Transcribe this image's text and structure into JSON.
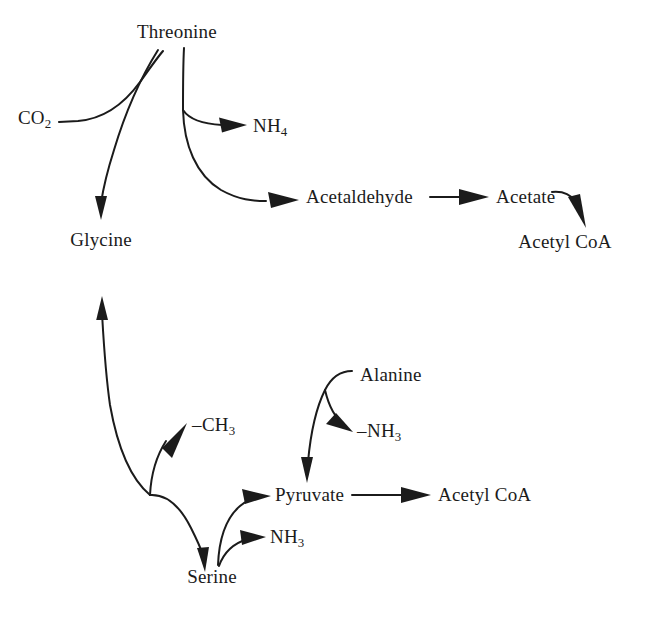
{
  "diagram": {
    "background_color": "#ffffff",
    "stroke_color": "#1b1b1b",
    "text_color": "#1b1b1b",
    "width": 659,
    "height": 620,
    "nodes": [
      {
        "id": "threonine",
        "label": "Threonine",
        "x": 177,
        "y": 33,
        "anchor": "center"
      },
      {
        "id": "co2",
        "label": "CO",
        "sub": "2",
        "x": 18,
        "y": 118,
        "anchor": "left"
      },
      {
        "id": "nh4",
        "label": "NH",
        "sub": "4",
        "x": 253,
        "y": 126,
        "anchor": "left"
      },
      {
        "id": "glycine",
        "label": "Glycine",
        "x": 101,
        "y": 241,
        "anchor": "center"
      },
      {
        "id": "acetaldehyde",
        "label": "Acetaldehyde",
        "x": 306,
        "y": 198,
        "anchor": "left"
      },
      {
        "id": "acetate",
        "label": "Acetate",
        "x": 496,
        "y": 198,
        "anchor": "left"
      },
      {
        "id": "acetyl_coa_1",
        "label": "Acetyl CoA",
        "x": 565,
        "y": 243,
        "anchor": "center"
      },
      {
        "id": "ch3",
        "label": "CH",
        "sub": "3",
        "neg": true,
        "x": 192,
        "y": 426,
        "anchor": "left"
      },
      {
        "id": "alanine",
        "label": "Alanine",
        "x": 360,
        "y": 376,
        "anchor": "left"
      },
      {
        "id": "nh3_alanine",
        "label": "NH",
        "sub": "3",
        "neg": true,
        "x": 357,
        "y": 432,
        "anchor": "left"
      },
      {
        "id": "pyruvate",
        "label": "Pyruvate",
        "x": 275,
        "y": 496,
        "anchor": "left"
      },
      {
        "id": "nh3_serine",
        "label": "NH",
        "sub": "3",
        "x": 270,
        "y": 538,
        "anchor": "left"
      },
      {
        "id": "acetyl_coa_2",
        "label": "Acetyl CoA",
        "x": 438,
        "y": 496,
        "anchor": "left"
      },
      {
        "id": "serine",
        "label": "Serine",
        "x": 212,
        "y": 578,
        "anchor": "center"
      }
    ],
    "edges": [
      {
        "id": "co2-to-threonine",
        "from": "co2",
        "to": "threonine",
        "style": "curved",
        "arrowhead": false
      },
      {
        "id": "threonine-to-glycine",
        "from": "threonine",
        "to": "glycine",
        "style": "curved",
        "arrowhead": true
      },
      {
        "id": "threonine-to-nh4",
        "from": "threonine",
        "to": "nh4",
        "style": "curved",
        "arrowhead": true
      },
      {
        "id": "threonine-to-acetaldehyde",
        "from": "threonine",
        "to": "acetaldehyde",
        "style": "curved",
        "arrowhead": true
      },
      {
        "id": "acetaldehyde-to-acetate",
        "from": "acetaldehyde",
        "to": "acetate",
        "style": "straight",
        "arrowhead": true
      },
      {
        "id": "acetate-to-acetylcoa",
        "from": "acetate",
        "to": "acetyl_coa_1",
        "style": "curved",
        "arrowhead": true
      },
      {
        "id": "serine-to-glycine",
        "from": "serine",
        "to": "glycine",
        "style": "curved",
        "arrowhead": true
      },
      {
        "id": "serine-branch-to-ch3",
        "from": "serine",
        "to": "ch3",
        "style": "curved",
        "arrowhead": true
      },
      {
        "id": "glycine-branch-to-serine",
        "from": "glycine",
        "to": "serine",
        "style": "curved",
        "arrowhead": true
      },
      {
        "id": "serine-to-pyruvate",
        "from": "serine",
        "to": "pyruvate",
        "style": "curved",
        "arrowhead": true
      },
      {
        "id": "serine-to-nh3",
        "from": "serine",
        "to": "nh3_serine",
        "style": "curved",
        "arrowhead": true
      },
      {
        "id": "alanine-to-pyruvate",
        "from": "alanine",
        "to": "pyruvate",
        "style": "curved",
        "arrowhead": true
      },
      {
        "id": "alanine-to-nh3",
        "from": "alanine",
        "to": "nh3_alanine",
        "style": "curved",
        "arrowhead": true
      },
      {
        "id": "pyruvate-to-acetylcoa",
        "from": "pyruvate",
        "to": "acetyl_coa_2",
        "style": "straight",
        "arrowhead": true
      }
    ]
  }
}
